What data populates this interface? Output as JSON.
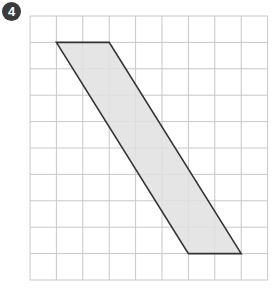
{
  "problem": {
    "number": "4"
  },
  "grid": {
    "columns": 9,
    "rows": 10,
    "origin_x": 30,
    "origin_y": 16,
    "cell": 26.4,
    "line_color": "#c8c8c8"
  },
  "shape": {
    "type": "parallelogram",
    "vertices_grid": [
      [
        1,
        1
      ],
      [
        3,
        1
      ],
      [
        8,
        9
      ],
      [
        6,
        9
      ]
    ],
    "fill": "#e0e0e0",
    "stroke": "#333333"
  }
}
